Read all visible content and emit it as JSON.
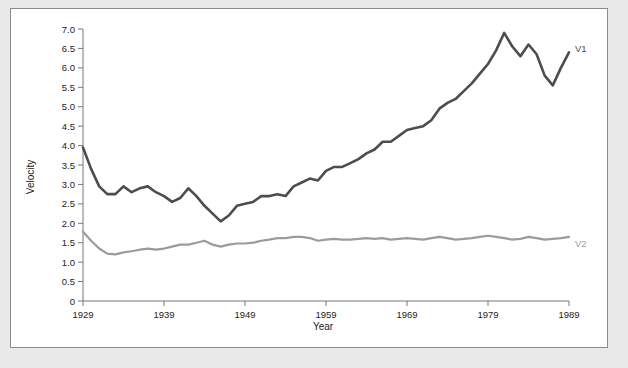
{
  "figure": {
    "background_color": "#e9e9e9",
    "panel_color": "#ffffff",
    "border_color": "#8c8c8c"
  },
  "axis": {
    "x_title": "Year",
    "y_title": "Velocity",
    "x_tick_labels": [
      "1929",
      "1939",
      "1949",
      "1959",
      "1969",
      "1979",
      "1989"
    ],
    "y_tick_labels": [
      "0",
      "0.5",
      "1.0",
      "1.5",
      "2.0",
      "2.5",
      "3.0",
      "3.5",
      "4.0",
      "4.5",
      "5.0",
      "5.5",
      "6.0",
      "6.5",
      "7.0"
    ]
  },
  "series_labels": {
    "v1": "V1",
    "v2": "V2"
  },
  "chart_data": {
    "type": "line",
    "title": "",
    "xlabel": "Year",
    "ylabel": "Velocity",
    "xlim": [
      1929,
      1989
    ],
    "ylim": [
      0,
      7.0
    ],
    "ytick_step": 0.5,
    "xtick_step": 10,
    "grid": false,
    "legend": "inline-right-labels",
    "x": [
      1929,
      1930,
      1931,
      1932,
      1933,
      1934,
      1935,
      1936,
      1937,
      1938,
      1939,
      1940,
      1941,
      1942,
      1943,
      1944,
      1945,
      1946,
      1947,
      1948,
      1949,
      1950,
      1951,
      1952,
      1953,
      1954,
      1955,
      1956,
      1957,
      1958,
      1959,
      1960,
      1961,
      1962,
      1963,
      1964,
      1965,
      1966,
      1967,
      1968,
      1969,
      1970,
      1971,
      1972,
      1973,
      1974,
      1975,
      1976,
      1977,
      1978,
      1979,
      1980,
      1981,
      1982,
      1983,
      1984,
      1985,
      1986,
      1987,
      1988,
      1989
    ],
    "series": [
      {
        "name": "V1",
        "color": "#4d4d4d",
        "values": [
          3.95,
          3.4,
          2.95,
          2.75,
          2.75,
          2.95,
          2.8,
          2.9,
          2.95,
          2.8,
          2.7,
          2.55,
          2.65,
          2.9,
          2.7,
          2.45,
          2.25,
          2.05,
          2.2,
          2.45,
          2.5,
          2.55,
          2.7,
          2.7,
          2.75,
          2.7,
          2.95,
          3.05,
          3.15,
          3.1,
          3.35,
          3.45,
          3.45,
          3.55,
          3.65,
          3.8,
          3.9,
          4.1,
          4.1,
          4.25,
          4.4,
          4.45,
          4.5,
          4.65,
          4.95,
          5.1,
          5.2,
          5.4,
          5.6,
          5.85,
          6.1,
          6.45,
          6.9,
          6.55,
          6.3,
          6.6,
          6.35,
          5.8,
          5.55,
          6.0,
          6.4
        ],
        "label_at_end": "V1"
      },
      {
        "name": "V2",
        "color": "#9b9b9b",
        "values": [
          1.78,
          1.55,
          1.35,
          1.22,
          1.2,
          1.25,
          1.28,
          1.32,
          1.35,
          1.32,
          1.35,
          1.4,
          1.45,
          1.45,
          1.5,
          1.55,
          1.45,
          1.4,
          1.45,
          1.48,
          1.48,
          1.5,
          1.55,
          1.58,
          1.62,
          1.62,
          1.65,
          1.65,
          1.62,
          1.55,
          1.58,
          1.6,
          1.58,
          1.58,
          1.6,
          1.62,
          1.6,
          1.62,
          1.58,
          1.6,
          1.62,
          1.6,
          1.58,
          1.62,
          1.65,
          1.62,
          1.58,
          1.6,
          1.62,
          1.65,
          1.68,
          1.65,
          1.62,
          1.58,
          1.6,
          1.65,
          1.62,
          1.58,
          1.6,
          1.62,
          1.65
        ],
        "label_at_end": "V2"
      }
    ]
  }
}
